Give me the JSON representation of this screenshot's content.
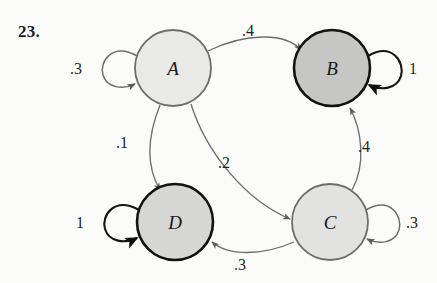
{
  "problem": {
    "number": "23."
  },
  "diagram": {
    "type": "markov-chain-state-diagram",
    "nodes": [
      {
        "id": "A",
        "label": "A",
        "cx": 173,
        "cy": 68,
        "r": 38,
        "fill": "#e9e9e7",
        "stroke": "#6d6d6d",
        "stroke_width": 1.8
      },
      {
        "id": "B",
        "label": "B",
        "cx": 332,
        "cy": 68,
        "r": 38,
        "fill": "#c6c6c4",
        "stroke": "#121212",
        "stroke_width": 2.6
      },
      {
        "id": "C",
        "label": "C",
        "cx": 330,
        "cy": 222,
        "r": 38,
        "fill": "#e2e2e0",
        "stroke": "#6d6d6d",
        "stroke_width": 1.8
      },
      {
        "id": "D",
        "label": "D",
        "cx": 175,
        "cy": 222,
        "r": 38,
        "fill": "#d6d6d4",
        "stroke": "#121212",
        "stroke_width": 2.6
      }
    ],
    "edges": [
      {
        "from": "A",
        "to": "B",
        "label": ".4",
        "label_x": 248,
        "label_y": 36
      },
      {
        "from": "A",
        "to": "D",
        "label": ".1",
        "label_x": 122,
        "label_y": 148
      },
      {
        "from": "A",
        "to": "C",
        "label": ".2",
        "label_x": 224,
        "label_y": 168
      },
      {
        "from": "C",
        "to": "B",
        "label": ".4",
        "label_x": 364,
        "label_y": 152
      },
      {
        "from": "C",
        "to": "D",
        "label": ".3",
        "label_x": 240,
        "label_y": 270
      }
    ],
    "self_loops": [
      {
        "node": "A",
        "label": ".3",
        "label_x": 76,
        "label_y": 74,
        "side": "left",
        "dark": false
      },
      {
        "node": "B",
        "label": "1",
        "label_x": 413,
        "label_y": 74,
        "side": "right",
        "dark": true
      },
      {
        "node": "C",
        "label": ".3",
        "label_x": 412,
        "label_y": 228,
        "side": "right",
        "dark": false
      },
      {
        "node": "D",
        "label": "1",
        "label_x": 80,
        "label_y": 228,
        "side": "left",
        "dark": true
      }
    ]
  }
}
